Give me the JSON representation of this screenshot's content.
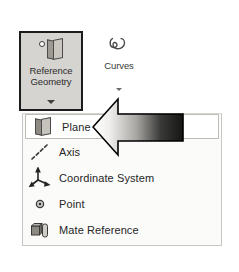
{
  "app": {
    "name": "CAD Reference Geometry Menu",
    "background_color": "#ffffff"
  },
  "ribbon": {
    "buttons": [
      {
        "id": "reference-geometry",
        "label_line1": "Reference",
        "label_line2": "Geometry",
        "icon": "plane-icon",
        "state": "pressed",
        "has_dropdown": true,
        "border_color": "#1c1c1c",
        "fill_color": "#d6d4d0"
      },
      {
        "id": "curves",
        "label": "Curves",
        "icon": "curve-spline-icon",
        "state": "normal",
        "has_dropdown": true
      }
    ]
  },
  "flyout": {
    "open": true,
    "owner": "reference-geometry",
    "background_color": "#fbfbfa",
    "border_color": "#c8c6c2",
    "selected_index": 0,
    "items": [
      {
        "label": "Plane",
        "icon": "plane-icon",
        "selected": true
      },
      {
        "label": "Axis",
        "icon": "axis-dashed-line-icon",
        "selected": false
      },
      {
        "label": "Coordinate System",
        "icon": "coordinate-triad-icon",
        "selected": false
      },
      {
        "label": "Point",
        "icon": "point-dot-icon",
        "selected": false
      },
      {
        "label": "Mate Reference",
        "icon": "mate-reference-icon",
        "selected": false
      }
    ]
  },
  "annotation": {
    "type": "callout-arrow",
    "direction": "left",
    "points_to": "Plane",
    "gradient_from": "#f2f2f2",
    "gradient_to": "#1e1e1e",
    "outline_color": "#000000"
  }
}
